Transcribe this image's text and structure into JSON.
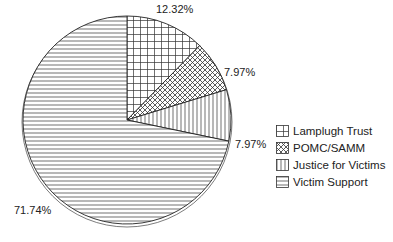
{
  "chart_data": {
    "type": "pie",
    "title": "",
    "slices": [
      {
        "label": "Lamplugh Trust",
        "value": 12.32,
        "display": "12.32%",
        "pattern": "grid"
      },
      {
        "label": "POMC/SAMM",
        "value": 7.97,
        "display": "7.97%",
        "pattern": "crosshatch"
      },
      {
        "label": "Justice for Victims",
        "value": 7.97,
        "display": "7.97%",
        "pattern": "vertical"
      },
      {
        "label": "Victim Support",
        "value": 71.74,
        "display": "71.74%",
        "pattern": "horizontal"
      }
    ],
    "legend_position": "right",
    "start_angle": "top, clockwise"
  },
  "labels": {
    "lamplugh": "12.32%",
    "pomc": "7.97%",
    "justice": "7.97%",
    "victim": "71.74%"
  },
  "legend": {
    "items": [
      {
        "label": "Lamplugh Trust"
      },
      {
        "label": "POMC/SAMM"
      },
      {
        "label": "Justice for Victims"
      },
      {
        "label": "Victim Support"
      }
    ]
  }
}
